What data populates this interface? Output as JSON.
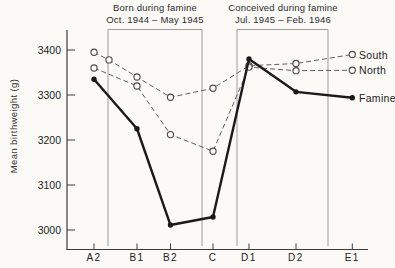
{
  "chart_data": {
    "type": "line",
    "title": "",
    "xlabel": "",
    "ylabel": "Mean birthweight (g)",
    "y_ticks": [
      3400,
      3300,
      3200,
      3100,
      3000
    ],
    "ylim": [
      2950,
      3445
    ],
    "categories": [
      "A2",
      "B1",
      "B2",
      "C",
      "D1",
      "D2",
      "E1"
    ],
    "grid": false,
    "legend_position": "right-of-last-points",
    "annotation_boxes": [
      {
        "title": "Born during famine",
        "dates": "Oct. 1944 – May 1945"
      },
      {
        "title": "Conceived during famine",
        "dates": "Jul. 1945 – Feb. 1946"
      }
    ],
    "series": [
      {
        "name": "South",
        "line": "dashed",
        "marker": "open-circle",
        "values": [
          3395,
          3340,
          3295,
          3315,
          3365,
          3370,
          3390
        ]
      },
      {
        "name": "North",
        "line": "dashed",
        "marker": "open-circle",
        "values": [
          3360,
          3320,
          3212,
          3175,
          3362,
          3354,
          3355
        ]
      },
      {
        "name": "Famine",
        "line": "solid",
        "marker": "filled-circle",
        "values": [
          3335,
          3225,
          3011,
          3029,
          3380,
          3307,
          3294
        ]
      }
    ],
    "extra_markers": [
      {
        "series": "South",
        "after_category": "A2",
        "value": 3378
      }
    ],
    "colors": {
      "dashed_line": "#5f5f5f",
      "solid_line": "#1a1a1a",
      "axis": "#3c3c3c",
      "box": "#9c9c9c",
      "paper": "#fbfaf7",
      "text": "#222222"
    },
    "layout_px": {
      "category_x": [
        94,
        137,
        170.5,
        213,
        249,
        296,
        352.3
      ],
      "extra_marker_x": [
        109
      ],
      "y_anchor_value": 3400,
      "y_anchor_px": 50,
      "px_per_100g": 45,
      "axis_x": 67,
      "axis_bottom_y": 249.5,
      "axis_top_y": 30,
      "axis_right_x": 368,
      "box_x": [
        [
          108,
          202
        ],
        [
          237,
          328
        ]
      ],
      "box_top_y": 29.5,
      "box_bottom_y": 246,
      "legend_x": 359
    }
  }
}
